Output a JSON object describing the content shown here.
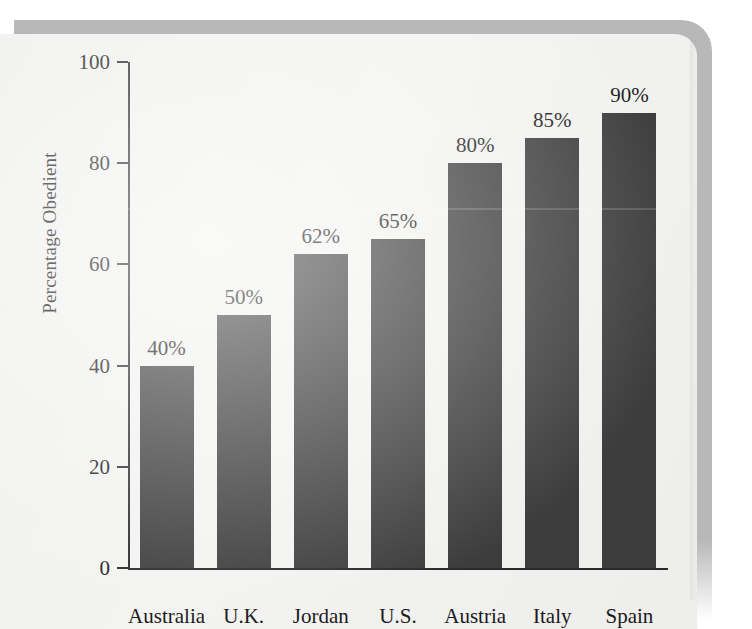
{
  "chart_data": {
    "type": "bar",
    "title": "",
    "xlabel": "",
    "ylabel": "Percentage Obedient",
    "ylim": [
      0,
      100
    ],
    "ytick_labels": [
      "0",
      "20",
      "40",
      "60",
      "80",
      "100"
    ],
    "ytick_values": [
      0,
      20,
      40,
      60,
      80,
      100
    ],
    "grid": false,
    "legend": false,
    "categories": [
      "Australia",
      "U.K.",
      "Jordan",
      "U.S.",
      "Austria",
      "Italy",
      "Spain"
    ],
    "values": [
      40,
      50,
      62,
      65,
      80,
      85,
      90
    ],
    "data_labels": [
      "40%",
      "50%",
      "62%",
      "65%",
      "80%",
      "85%",
      "90%"
    ],
    "bar_color": "#3d3d3d",
    "background_color": "#f3f3f1",
    "axis_color": "#2a2a2a"
  }
}
